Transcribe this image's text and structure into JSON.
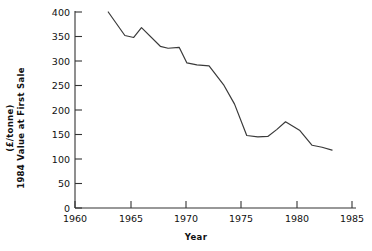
{
  "chart_data": {
    "type": "line",
    "title": "",
    "xlabel": "Year",
    "ylabel": "1984 Value at First Sale (£/tonne)",
    "ylabel_line1": "(£/tonne)",
    "ylabel_line2": "1984 Value at First Sale",
    "xlim": [
      1958.6,
      1986.2
    ],
    "ylim": [
      0,
      400
    ],
    "xticks": [
      1960,
      1965,
      1970,
      1975,
      1980,
      1985
    ],
    "xtick_labels": [
      "1960",
      "1965",
      "1970",
      "1975",
      "1980",
      "1985"
    ],
    "yticks": [
      0,
      50,
      100,
      150,
      200,
      250,
      300,
      350,
      400
    ],
    "ytick_labels": [
      "0",
      "50",
      "100",
      "150",
      "200",
      "250",
      "300",
      "350",
      "400"
    ],
    "grid": false,
    "legend": null,
    "line_color": "#3a3a3a",
    "x": [
      1963.0,
      1964.5,
      1965.3,
      1966.0,
      1967.7,
      1968.4,
      1969.4,
      1970.1,
      1971.0,
      1972.1,
      1973.4,
      1974.4,
      1975.5,
      1976.5,
      1977.4,
      1978.2,
      1979.0,
      1980.3,
      1981.4,
      1982.3,
      1983.2
    ],
    "values": [
      400,
      352,
      348,
      368,
      330,
      326,
      328,
      296,
      292,
      290,
      252,
      212,
      148,
      145,
      146,
      160,
      176,
      158,
      128,
      124,
      118
    ]
  },
  "axis": {
    "x_title": "Year",
    "y_title_upper": "(£/tonne)",
    "y_title_lower": "1984 Value at First Sale"
  }
}
